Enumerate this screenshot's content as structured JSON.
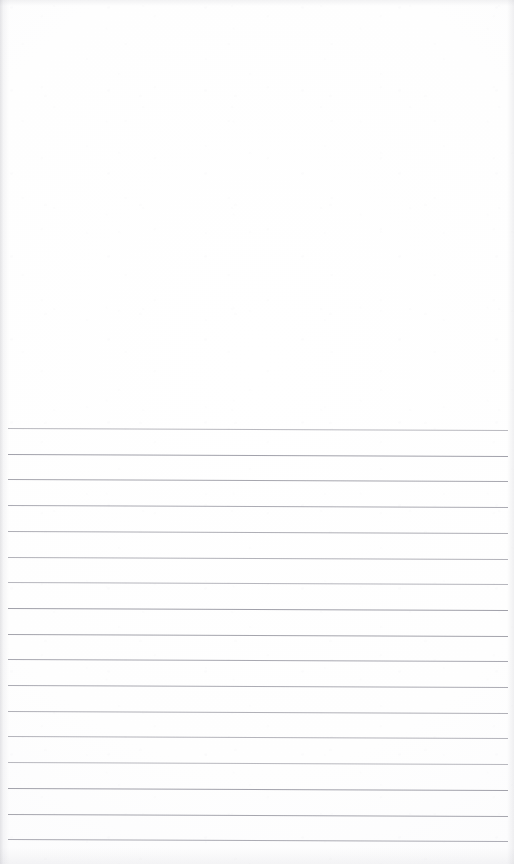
{
  "document": {
    "type": "scanned-page",
    "kind": "blank ruled notepad sheet",
    "page_width": 514,
    "page_height": 864,
    "paper_color": "#fefefe",
    "has_text": false,
    "has_handwriting": false,
    "blank_region": {
      "label": "blank unruled upper area",
      "top": 0,
      "height": 426
    },
    "ruled_region": {
      "label": "ruled writing lines",
      "first_line_y": 428,
      "line_spacing": 25.7,
      "line_count": 17,
      "line_color": "#94949e",
      "line_thickness": 1,
      "line_left": 8,
      "line_right": 508,
      "tilt_px": 2
    }
  }
}
